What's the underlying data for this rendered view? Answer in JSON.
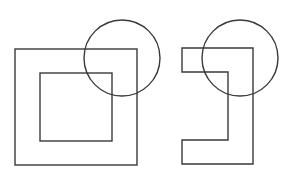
{
  "diagram": {
    "background": "#ffffff",
    "stroke_color": "#3a3a3a",
    "figures": [
      {
        "name": "square-frame-with-circle",
        "outer_square": {
          "x": 15,
          "y": 49,
          "width": 122,
          "height": 116
        },
        "inner_square": {
          "x": 40,
          "y": 73,
          "width": 72,
          "height": 68
        },
        "circle": {
          "cx": 122,
          "cy": 58,
          "r": 38
        }
      },
      {
        "name": "bracket-shape-with-circle",
        "polygon_points": "182,48 253,48 253,164 182,164 182,140 228,140 228,72 182,72",
        "circle": {
          "cx": 240,
          "cy": 58,
          "r": 38
        }
      }
    ]
  }
}
